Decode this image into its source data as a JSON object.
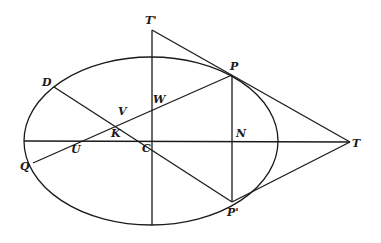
{
  "diagram": {
    "ellipse": {
      "cx": 151,
      "cy": 141,
      "rx": 127,
      "ry": 84
    },
    "points": {
      "T_prime": {
        "label": "T'",
        "x": 152,
        "y": 30,
        "lx": 145,
        "ly": 24
      },
      "P": {
        "label": "P",
        "x": 232,
        "y": 75,
        "lx": 230,
        "ly": 70
      },
      "P_prime": {
        "label": "P'",
        "x": 232,
        "y": 202,
        "lx": 227,
        "ly": 216
      },
      "T": {
        "label": "T",
        "x": 350,
        "y": 142,
        "lx": 352,
        "ly": 147
      },
      "N": {
        "label": "N",
        "x": 232,
        "y": 142,
        "lx": 236,
        "ly": 137
      },
      "D": {
        "label": "D",
        "x": 54,
        "y": 87,
        "lx": 42,
        "ly": 86
      },
      "Q": {
        "label": "Q",
        "x": 33,
        "y": 163,
        "lx": 20,
        "ly": 170
      },
      "U": {
        "label": "U",
        "x": 78,
        "y": 142,
        "lx": 71,
        "ly": 153
      },
      "V": {
        "label": "V",
        "x": 120,
        "y": 118,
        "lx": 118,
        "ly": 115
      },
      "K": {
        "label": "K",
        "x": 115,
        "y": 128,
        "lx": 111,
        "ly": 137
      },
      "W": {
        "label": "W",
        "x": 152,
        "y": 104,
        "lx": 153,
        "ly": 103
      },
      "C": {
        "label": "C",
        "x": 151,
        "y": 142,
        "lx": 142,
        "ly": 152
      }
    }
  }
}
